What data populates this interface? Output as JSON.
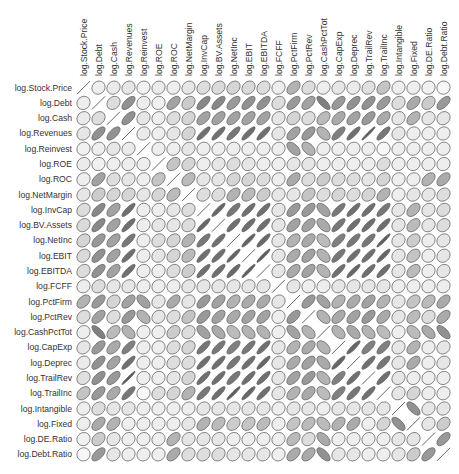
{
  "chart_data": {
    "type": "heatmap",
    "style": "correlation-ellipse-matrix",
    "title": "",
    "variables": [
      "log.Stock.Price",
      "log.Debt",
      "log.Cash",
      "log.Revenues",
      "log.Reinvest",
      "log.ROE",
      "log.ROC",
      "log.NetMargin",
      "log.InvCap",
      "log.BV.Assets",
      "log.NetInc",
      "log.EBIT",
      "log.EBITDA",
      "log.FCFF",
      "log.PctFirm",
      "log.PctRev",
      "log.CashPctTot",
      "log.CapExp",
      "log.Deprec",
      "log.TrailRev",
      "log.TrailInc",
      "log.Intangible",
      "log.Fixed",
      "log.DE.Ratio",
      "log.Debt.Ratio"
    ],
    "matrix": [
      [
        1.0,
        0.1,
        0.12,
        0.15,
        0.08,
        0.12,
        0.1,
        0.15,
        0.2,
        0.22,
        0.25,
        0.22,
        0.2,
        0.1,
        0.45,
        0.2,
        0.1,
        0.15,
        0.12,
        0.18,
        0.35,
        0.1,
        0.1,
        0.08,
        0.05
      ],
      [
        0.1,
        1.0,
        0.2,
        0.65,
        0.1,
        0.08,
        0.55,
        0.3,
        0.7,
        0.7,
        0.6,
        0.65,
        0.65,
        0.2,
        0.6,
        0.55,
        -0.75,
        0.6,
        0.65,
        0.65,
        0.6,
        0.2,
        0.5,
        0.3,
        0.6
      ],
      [
        0.12,
        0.2,
        1.0,
        0.65,
        0.15,
        0.1,
        0.2,
        0.25,
        0.55,
        0.55,
        0.55,
        0.55,
        0.55,
        0.15,
        0.25,
        0.2,
        0.4,
        0.5,
        0.55,
        0.6,
        0.5,
        0.15,
        0.45,
        0.15,
        0.15
      ],
      [
        0.15,
        0.65,
        0.65,
        1.0,
        0.12,
        0.1,
        0.15,
        0.25,
        0.85,
        0.85,
        0.8,
        0.85,
        0.85,
        0.15,
        0.55,
        0.6,
        -0.45,
        0.75,
        0.85,
        0.97,
        0.8,
        0.15,
        0.1,
        0.1,
        0.1
      ],
      [
        0.08,
        0.1,
        0.15,
        0.12,
        1.0,
        0.1,
        0.1,
        0.15,
        0.1,
        0.1,
        0.1,
        0.1,
        0.1,
        0.1,
        -0.55,
        -0.45,
        0.1,
        0.1,
        0.1,
        0.1,
        0.05,
        0.1,
        0.1,
        0.1,
        0.1
      ],
      [
        0.12,
        0.08,
        0.1,
        0.1,
        0.1,
        1.0,
        0.35,
        0.25,
        0.1,
        0.15,
        0.2,
        0.15,
        0.1,
        0.1,
        0.15,
        0.15,
        0.1,
        0.1,
        0.1,
        0.1,
        0.2,
        0.1,
        0.1,
        0.1,
        0.1
      ],
      [
        0.1,
        0.55,
        0.2,
        0.15,
        0.1,
        0.35,
        1.0,
        0.4,
        0.15,
        0.15,
        0.25,
        0.25,
        0.2,
        0.1,
        0.5,
        0.2,
        0.3,
        0.2,
        0.2,
        0.15,
        0.25,
        0.1,
        0.1,
        0.45,
        0.5
      ],
      [
        0.15,
        0.3,
        0.25,
        0.25,
        0.15,
        0.25,
        0.4,
        1.0,
        0.2,
        0.2,
        0.45,
        0.4,
        0.3,
        0.15,
        0.15,
        0.35,
        0.2,
        0.25,
        0.2,
        0.25,
        0.45,
        0.1,
        0.15,
        0.15,
        0.2
      ],
      [
        0.2,
        0.7,
        0.55,
        0.85,
        0.1,
        0.1,
        0.15,
        0.2,
        1.0,
        0.9,
        0.8,
        0.85,
        0.85,
        0.15,
        0.6,
        0.6,
        -0.55,
        0.8,
        0.85,
        0.85,
        0.8,
        0.15,
        0.45,
        0.15,
        0.2
      ],
      [
        0.22,
        0.7,
        0.55,
        0.85,
        0.1,
        0.15,
        0.15,
        0.2,
        0.9,
        1.0,
        0.85,
        0.85,
        0.85,
        0.15,
        0.55,
        0.55,
        -0.5,
        0.8,
        0.85,
        0.85,
        0.85,
        0.15,
        0.4,
        0.15,
        0.2
      ],
      [
        0.25,
        0.6,
        0.55,
        0.8,
        0.1,
        0.2,
        0.25,
        0.45,
        0.8,
        0.85,
        1.0,
        0.92,
        0.88,
        0.15,
        0.45,
        0.5,
        -0.4,
        0.75,
        0.8,
        0.8,
        0.95,
        0.15,
        0.3,
        0.1,
        0.15
      ],
      [
        0.22,
        0.65,
        0.55,
        0.85,
        0.1,
        0.15,
        0.25,
        0.4,
        0.85,
        0.85,
        0.92,
        1.0,
        0.95,
        0.15,
        0.5,
        0.55,
        -0.45,
        0.8,
        0.85,
        0.85,
        0.9,
        0.15,
        0.35,
        0.1,
        0.15
      ],
      [
        0.2,
        0.65,
        0.55,
        0.85,
        0.1,
        0.1,
        0.2,
        0.3,
        0.85,
        0.85,
        0.88,
        0.95,
        1.0,
        0.15,
        0.5,
        0.55,
        -0.45,
        0.85,
        0.9,
        0.85,
        0.85,
        0.15,
        0.4,
        0.1,
        0.15
      ],
      [
        0.1,
        0.2,
        0.15,
        0.15,
        0.1,
        0.1,
        0.1,
        0.15,
        0.15,
        0.15,
        0.15,
        0.15,
        0.15,
        1.0,
        0.15,
        0.1,
        0.1,
        0.15,
        0.15,
        0.15,
        0.15,
        0.1,
        0.1,
        0.1,
        0.1
      ],
      [
        0.45,
        0.6,
        0.25,
        0.55,
        -0.55,
        0.15,
        0.5,
        0.15,
        0.6,
        0.55,
        0.45,
        0.5,
        0.5,
        0.15,
        1.0,
        0.6,
        -0.55,
        0.45,
        0.5,
        0.55,
        0.45,
        0.15,
        0.35,
        0.4,
        0.5
      ],
      [
        0.2,
        0.55,
        0.2,
        0.6,
        -0.45,
        0.15,
        0.2,
        0.35,
        0.6,
        0.55,
        0.5,
        0.55,
        0.55,
        0.1,
        0.6,
        1.0,
        -0.45,
        0.5,
        0.55,
        0.6,
        0.5,
        0.15,
        0.4,
        0.2,
        0.5
      ],
      [
        0.1,
        -0.75,
        0.4,
        -0.45,
        0.1,
        0.1,
        0.3,
        0.2,
        -0.55,
        -0.5,
        -0.4,
        -0.45,
        -0.45,
        0.1,
        -0.55,
        -0.45,
        1.0,
        -0.45,
        -0.5,
        -0.45,
        -0.4,
        0.1,
        -0.4,
        -0.5,
        -0.65
      ],
      [
        0.15,
        0.6,
        0.5,
        0.75,
        0.1,
        0.1,
        0.2,
        0.25,
        0.8,
        0.8,
        0.75,
        0.8,
        0.85,
        0.15,
        0.45,
        0.5,
        -0.45,
        1.0,
        0.9,
        0.75,
        0.75,
        0.15,
        0.45,
        0.1,
        0.15
      ],
      [
        0.12,
        0.65,
        0.55,
        0.85,
        0.1,
        0.1,
        0.2,
        0.2,
        0.85,
        0.85,
        0.8,
        0.85,
        0.9,
        0.15,
        0.5,
        0.55,
        -0.5,
        0.9,
        1.0,
        0.85,
        0.8,
        0.15,
        0.5,
        0.1,
        0.15
      ],
      [
        0.18,
        0.65,
        0.6,
        0.97,
        0.1,
        0.1,
        0.15,
        0.25,
        0.85,
        0.85,
        0.8,
        0.85,
        0.85,
        0.15,
        0.55,
        0.6,
        -0.45,
        0.75,
        0.85,
        1.0,
        0.85,
        0.15,
        0.1,
        0.1,
        0.1
      ],
      [
        0.35,
        0.6,
        0.5,
        0.8,
        0.05,
        0.2,
        0.25,
        0.45,
        0.8,
        0.85,
        0.95,
        0.9,
        0.85,
        0.15,
        0.45,
        0.5,
        -0.4,
        0.75,
        0.8,
        0.85,
        1.0,
        0.15,
        0.25,
        0.1,
        0.1
      ],
      [
        0.1,
        0.2,
        0.15,
        0.15,
        0.1,
        0.1,
        0.1,
        0.1,
        0.15,
        0.15,
        0.15,
        0.15,
        0.15,
        0.1,
        0.15,
        0.15,
        0.1,
        0.15,
        0.15,
        0.15,
        0.15,
        1.0,
        -0.65,
        0.15,
        0.15
      ],
      [
        0.1,
        0.5,
        0.45,
        0.1,
        0.1,
        0.1,
        0.1,
        0.15,
        0.45,
        0.4,
        0.3,
        0.35,
        0.4,
        0.1,
        0.35,
        0.4,
        -0.4,
        0.45,
        0.5,
        0.1,
        0.25,
        -0.65,
        1.0,
        0.15,
        0.3
      ],
      [
        0.08,
        0.3,
        0.15,
        0.1,
        0.1,
        0.1,
        0.45,
        0.15,
        0.15,
        0.15,
        0.1,
        0.1,
        0.1,
        0.1,
        0.4,
        0.2,
        -0.5,
        0.1,
        0.1,
        0.1,
        0.1,
        0.15,
        0.15,
        1.0,
        0.6
      ],
      [
        0.05,
        0.6,
        0.15,
        0.1,
        0.1,
        0.1,
        0.5,
        0.2,
        0.2,
        0.2,
        0.15,
        0.15,
        0.15,
        0.1,
        0.5,
        0.5,
        -0.65,
        0.15,
        0.15,
        0.1,
        0.1,
        0.15,
        0.3,
        0.6,
        1.0
      ]
    ],
    "encoding": "ellipse eccentricity and fill darkness proportional to |r|; '/' tilt positive, '\\' tilt negative; diagonal drawn as line",
    "layout": {
      "grid": false,
      "legend": "none",
      "x_labels_position": "top, rotated 90",
      "y_labels_position": "left"
    }
  },
  "colors": {
    "outline": "#666666",
    "fill_light": "#ffffff",
    "fill_dark": "#555555",
    "label": "#333333"
  }
}
